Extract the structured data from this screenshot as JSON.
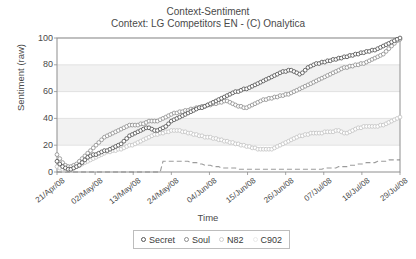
{
  "chart_data": {
    "type": "line",
    "title": "Context-Sentiment",
    "subtitle": "Context: LG Competitors EN - (C) Onalytica",
    "xlabel": "Time",
    "ylabel": "Sentiment (raw)",
    "ylim": [
      0,
      100
    ],
    "yticks": [
      0,
      20,
      40,
      60,
      80,
      100
    ],
    "grid": "horizontal-banded",
    "legend_position": "bottom-center",
    "x_tick_labels": [
      "21/Apr/08",
      "02/May/08",
      "13/May/08",
      "24/May/08",
      "04/Jun/08",
      "15/Jun/08",
      "26/Jun/08",
      "07/Jul/08",
      "18/Jul/08",
      "29/Jul/08"
    ],
    "series": [
      {
        "name": "Secret",
        "marker": "open-circle",
        "color": "#4a4a4a",
        "values": [
          8,
          6,
          4,
          3,
          2,
          2,
          3,
          4,
          5,
          7,
          9,
          11,
          12,
          13,
          13,
          14,
          15,
          16,
          16,
          17,
          18,
          19,
          20,
          21,
          23,
          25,
          27,
          28,
          29,
          30,
          31,
          32,
          33,
          33,
          32,
          31,
          31,
          32,
          33,
          34,
          36,
          38,
          39,
          40,
          41,
          42,
          43,
          44,
          45,
          46,
          47,
          48,
          48,
          49,
          50,
          51,
          52,
          53,
          54,
          55,
          56,
          57,
          58,
          59,
          60,
          60,
          61,
          62,
          62,
          63,
          64,
          65,
          66,
          67,
          68,
          69,
          70,
          71,
          72,
          73,
          74,
          75,
          75,
          76,
          76,
          75,
          74,
          73,
          74,
          76,
          78,
          79,
          80,
          81,
          81,
          82,
          82,
          83,
          83,
          84,
          84,
          85,
          85,
          86,
          86,
          87,
          87,
          88,
          88,
          89,
          89,
          90,
          90,
          91,
          91,
          92,
          93,
          94,
          95,
          96,
          97,
          98,
          99,
          100
        ]
      },
      {
        "name": "Soul",
        "marker": "open-circle",
        "color": "#8c8c8c",
        "values": [
          13,
          10,
          7,
          5,
          4,
          4,
          5,
          6,
          8,
          10,
          12,
          14,
          16,
          18,
          20,
          22,
          24,
          26,
          27,
          28,
          29,
          30,
          31,
          32,
          33,
          34,
          35,
          35,
          35,
          35,
          36,
          36,
          37,
          38,
          38,
          38,
          38,
          39,
          40,
          41,
          42,
          43,
          44,
          44,
          45,
          45,
          46,
          46,
          47,
          47,
          48,
          48,
          49,
          49,
          50,
          50,
          51,
          51,
          52,
          52,
          53,
          53,
          52,
          51,
          50,
          49,
          49,
          48,
          48,
          49,
          50,
          51,
          52,
          53,
          54,
          54,
          55,
          55,
          56,
          56,
          57,
          57,
          58,
          58,
          59,
          60,
          61,
          62,
          63,
          64,
          65,
          66,
          67,
          68,
          69,
          70,
          71,
          72,
          73,
          74,
          75,
          76,
          77,
          78,
          78,
          79,
          79,
          80,
          80,
          81,
          81,
          82,
          83,
          84,
          85,
          86,
          87,
          88,
          90,
          92,
          94,
          96,
          98,
          99
        ]
      },
      {
        "name": "N82",
        "marker": "open-circle",
        "color": "#c2c2c2",
        "values": [
          4,
          3,
          2,
          2,
          2,
          2,
          3,
          4,
          5,
          6,
          7,
          8,
          9,
          10,
          11,
          12,
          13,
          14,
          15,
          15,
          16,
          16,
          17,
          17,
          18,
          19,
          20,
          20,
          21,
          22,
          23,
          24,
          25,
          26,
          27,
          28,
          28,
          29,
          29,
          30,
          30,
          31,
          31,
          31,
          31,
          30,
          30,
          29,
          29,
          28,
          28,
          27,
          27,
          26,
          26,
          26,
          25,
          25,
          24,
          24,
          23,
          23,
          22,
          22,
          21,
          21,
          20,
          20,
          19,
          19,
          18,
          18,
          17,
          17,
          17,
          17,
          17,
          17,
          18,
          19,
          20,
          21,
          22,
          23,
          24,
          25,
          26,
          27,
          27,
          28,
          28,
          29,
          29,
          29,
          29,
          29,
          30,
          30,
          30,
          30,
          31,
          31,
          30,
          29,
          29,
          30,
          31,
          32,
          33,
          33,
          34,
          34,
          34,
          34,
          34,
          34,
          35,
          35,
          36,
          37,
          38,
          39,
          40,
          41
        ]
      },
      {
        "name": "C902",
        "marker": "dashed-line",
        "color": "#7a7a7a",
        "values": [
          0,
          0,
          0,
          0,
          0,
          0,
          0,
          0,
          0,
          0,
          0,
          0,
          0,
          0,
          0,
          0,
          0,
          0,
          0,
          0,
          0,
          0,
          0,
          0,
          0,
          0,
          0,
          0,
          0,
          0,
          0,
          0,
          0,
          0,
          0,
          0,
          0,
          0,
          8,
          8,
          8,
          8,
          8,
          8,
          8,
          8,
          8,
          8,
          7,
          7,
          7,
          6,
          6,
          5,
          5,
          5,
          4,
          4,
          4,
          3,
          3,
          3,
          3,
          3,
          3,
          2,
          2,
          2,
          2,
          2,
          2,
          2,
          2,
          2,
          2,
          2,
          2,
          2,
          2,
          2,
          2,
          2,
          2,
          2,
          2,
          2,
          2,
          2,
          2,
          2,
          2,
          2,
          2,
          2,
          2,
          2,
          3,
          3,
          3,
          3,
          3,
          4,
          4,
          4,
          4,
          5,
          5,
          5,
          6,
          6,
          6,
          7,
          7,
          7,
          7,
          8,
          8,
          8,
          8,
          9,
          9,
          9,
          9,
          9
        ]
      }
    ]
  },
  "legend": {
    "entries": [
      {
        "label": "Secret"
      },
      {
        "label": "Soul"
      },
      {
        "label": "N82"
      },
      {
        "label": "C902"
      }
    ]
  }
}
